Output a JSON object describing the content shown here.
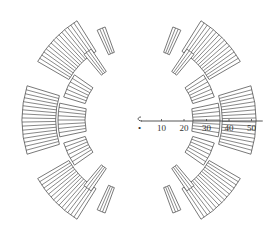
{
  "diagram": {
    "title": "",
    "center": {
      "x": 139,
      "y": 120
    },
    "px_per_unit": 2.25,
    "stroke_color": "#555555",
    "background": "#ffffff",
    "scale_bar": {
      "origin_label": "0",
      "ticks": [
        {
          "value": 10,
          "label": "10"
        },
        {
          "value": 20,
          "label": "20"
        },
        {
          "value": 30,
          "label": "30"
        },
        {
          "value": 40,
          "label": "40"
        },
        {
          "value": 50,
          "label": "50"
        }
      ],
      "length": 55
    },
    "segments": [
      {
        "name": "outer-left-top",
        "r_in": 36,
        "r_out": 52,
        "a_start": 122,
        "a_end": 150,
        "stripes": 15
      },
      {
        "name": "outer-left-mid",
        "r_in": 37,
        "r_out": 52,
        "a_start": 163,
        "a_end": 197,
        "stripes": 17
      },
      {
        "name": "outer-left-bottom",
        "r_in": 36,
        "r_out": 52,
        "a_start": 210,
        "a_end": 238,
        "stripes": 15
      },
      {
        "name": "inner-left-upper",
        "r_in": 25,
        "r_out": 35,
        "a_start": 145,
        "a_end": 163,
        "stripes": 6
      },
      {
        "name": "inner-left-mid",
        "r_in": 24,
        "r_out": 36,
        "a_start": 168,
        "a_end": 192,
        "stripes": 8
      },
      {
        "name": "inner-left-lower",
        "r_in": 25,
        "r_out": 35,
        "a_start": 197,
        "a_end": 215,
        "stripes": 6
      },
      {
        "name": "thin-left-top-a",
        "r_in": 26,
        "r_out": 38,
        "a_start": 124,
        "a_end": 130,
        "stripes": 3
      },
      {
        "name": "thin-left-top-b",
        "r_in": 32,
        "r_out": 44,
        "a_start": 110,
        "a_end": 115,
        "stripes": 3
      },
      {
        "name": "thin-left-bot-a",
        "r_in": 26,
        "r_out": 38,
        "a_start": 230,
        "a_end": 236,
        "stripes": 3
      },
      {
        "name": "thin-left-bot-b",
        "r_in": 32,
        "r_out": 44,
        "a_start": 245,
        "a_end": 250,
        "stripes": 3
      },
      {
        "name": "outer-right-top",
        "r_in": 36,
        "r_out": 52,
        "a_start": 30,
        "a_end": 58,
        "stripes": 15
      },
      {
        "name": "outer-right-mid",
        "r_in": 37,
        "r_out": 52,
        "a_start": -17,
        "a_end": 17,
        "stripes": 17
      },
      {
        "name": "outer-right-bottom",
        "r_in": 36,
        "r_out": 52,
        "a_start": -58,
        "a_end": -30,
        "stripes": 15
      },
      {
        "name": "inner-right-upper",
        "r_in": 25,
        "r_out": 35,
        "a_start": 17,
        "a_end": 35,
        "stripes": 6
      },
      {
        "name": "inner-right-mid",
        "r_in": 24,
        "r_out": 36,
        "a_start": -12,
        "a_end": 12,
        "stripes": 8
      },
      {
        "name": "inner-right-lower",
        "r_in": 25,
        "r_out": 35,
        "a_start": -35,
        "a_end": -17,
        "stripes": 6
      },
      {
        "name": "thin-right-top-a",
        "r_in": 26,
        "r_out": 38,
        "a_start": 50,
        "a_end": 56,
        "stripes": 3
      },
      {
        "name": "thin-right-top-b",
        "r_in": 32,
        "r_out": 44,
        "a_start": 65,
        "a_end": 70,
        "stripes": 3
      },
      {
        "name": "thin-right-bot-a",
        "r_in": 26,
        "r_out": 38,
        "a_start": -56,
        "a_end": -50,
        "stripes": 3
      },
      {
        "name": "thin-right-bot-b",
        "r_in": 32,
        "r_out": 44,
        "a_start": -70,
        "a_end": -65,
        "stripes": 3
      }
    ]
  }
}
